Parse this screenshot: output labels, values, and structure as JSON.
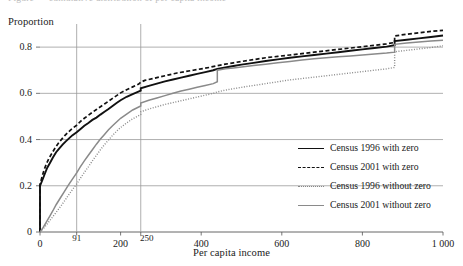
{
  "figure": {
    "cropped_caption": "Figure — cumulative distribution of per capita income"
  },
  "chart_data": {
    "type": "line",
    "title": "",
    "xlabel": "Per capita income",
    "ylabel": "Proportion",
    "xlim": [
      0,
      1000
    ],
    "ylim": [
      0,
      0.9
    ],
    "xticks": [
      0,
      91,
      200,
      250,
      400,
      600,
      800,
      1000
    ],
    "xticklabels": [
      "0",
      "91",
      "200",
      "250",
      "400",
      "600",
      "800",
      "1 000"
    ],
    "yticks": [
      0,
      0.2,
      0.4,
      0.6,
      0.8
    ],
    "yticklabels": [
      "0",
      "0.2",
      "0.4",
      "0.6",
      "0.8"
    ],
    "grid": "horizontal",
    "legend_position": "lower-right",
    "reference_lines": [
      {
        "name": "poverty-line-91",
        "x": 91,
        "label": "91"
      },
      {
        "name": "poverty-line-250",
        "x": 250,
        "label": "250"
      }
    ],
    "colors": {
      "census_1996_with_zero": "#111111",
      "census_2001_with_zero": "#111111",
      "census_1996_without_zero": "#8a8a8a",
      "census_2001_without_zero": "#8a8a8a",
      "gridline": "#9a9a9a",
      "axis": "#555555"
    },
    "series": [
      {
        "name": "Census 1996 with zero",
        "key": "census-1996-with-zero",
        "style": "solid",
        "color": "#111111",
        "width": 1.9,
        "points": [
          [
            0,
            0.0
          ],
          [
            0,
            0.2
          ],
          [
            6,
            0.225
          ],
          [
            12,
            0.252
          ],
          [
            18,
            0.278
          ],
          [
            25,
            0.3
          ],
          [
            32,
            0.322
          ],
          [
            40,
            0.345
          ],
          [
            48,
            0.362
          ],
          [
            56,
            0.378
          ],
          [
            64,
            0.392
          ],
          [
            72,
            0.405
          ],
          [
            80,
            0.418
          ],
          [
            91,
            0.432
          ],
          [
            100,
            0.445
          ],
          [
            110,
            0.46
          ],
          [
            120,
            0.472
          ],
          [
            130,
            0.485
          ],
          [
            140,
            0.495
          ],
          [
            150,
            0.508
          ],
          [
            160,
            0.52
          ],
          [
            170,
            0.532
          ],
          [
            180,
            0.545
          ],
          [
            190,
            0.558
          ],
          [
            200,
            0.57
          ],
          [
            215,
            0.585
          ],
          [
            230,
            0.597
          ],
          [
            250,
            0.612
          ],
          [
            250,
            0.622
          ],
          [
            270,
            0.632
          ],
          [
            290,
            0.642
          ],
          [
            310,
            0.652
          ],
          [
            330,
            0.66
          ],
          [
            350,
            0.668
          ],
          [
            370,
            0.676
          ],
          [
            390,
            0.684
          ],
          [
            410,
            0.692
          ],
          [
            430,
            0.7
          ],
          [
            440,
            0.706
          ],
          [
            460,
            0.712
          ],
          [
            480,
            0.718
          ],
          [
            500,
            0.724
          ],
          [
            530,
            0.732
          ],
          [
            560,
            0.74
          ],
          [
            590,
            0.747
          ],
          [
            620,
            0.754
          ],
          [
            650,
            0.76
          ],
          [
            680,
            0.766
          ],
          [
            710,
            0.772
          ],
          [
            740,
            0.778
          ],
          [
            770,
            0.784
          ],
          [
            800,
            0.79
          ],
          [
            830,
            0.796
          ],
          [
            860,
            0.802
          ],
          [
            880,
            0.808
          ],
          [
            880,
            0.826
          ],
          [
            910,
            0.832
          ],
          [
            940,
            0.838
          ],
          [
            970,
            0.844
          ],
          [
            1000,
            0.85
          ]
        ]
      },
      {
        "name": "Census 2001 with zero",
        "key": "census-2001-with-zero",
        "style": "dashed",
        "color": "#111111",
        "width": 1.7,
        "points": [
          [
            0,
            0.0
          ],
          [
            0,
            0.205
          ],
          [
            5,
            0.238
          ],
          [
            10,
            0.268
          ],
          [
            16,
            0.295
          ],
          [
            22,
            0.318
          ],
          [
            30,
            0.342
          ],
          [
            38,
            0.365
          ],
          [
            46,
            0.385
          ],
          [
            54,
            0.402
          ],
          [
            62,
            0.418
          ],
          [
            70,
            0.432
          ],
          [
            80,
            0.448
          ],
          [
            91,
            0.462
          ],
          [
            100,
            0.478
          ],
          [
            110,
            0.492
          ],
          [
            120,
            0.505
          ],
          [
            130,
            0.518
          ],
          [
            140,
            0.53
          ],
          [
            150,
            0.542
          ],
          [
            160,
            0.554
          ],
          [
            170,
            0.566
          ],
          [
            180,
            0.578
          ],
          [
            190,
            0.59
          ],
          [
            200,
            0.602
          ],
          [
            215,
            0.616
          ],
          [
            230,
            0.628
          ],
          [
            245,
            0.64
          ],
          [
            250,
            0.648
          ],
          [
            260,
            0.656
          ],
          [
            280,
            0.664
          ],
          [
            300,
            0.672
          ],
          [
            320,
            0.68
          ],
          [
            340,
            0.688
          ],
          [
            360,
            0.694
          ],
          [
            380,
            0.7
          ],
          [
            400,
            0.706
          ],
          [
            420,
            0.712
          ],
          [
            440,
            0.72
          ],
          [
            460,
            0.726
          ],
          [
            480,
            0.732
          ],
          [
            500,
            0.738
          ],
          [
            530,
            0.746
          ],
          [
            560,
            0.754
          ],
          [
            590,
            0.76
          ],
          [
            620,
            0.766
          ],
          [
            650,
            0.772
          ],
          [
            680,
            0.778
          ],
          [
            710,
            0.784
          ],
          [
            740,
            0.79
          ],
          [
            770,
            0.796
          ],
          [
            800,
            0.802
          ],
          [
            830,
            0.808
          ],
          [
            860,
            0.814
          ],
          [
            880,
            0.82
          ],
          [
            880,
            0.848
          ],
          [
            910,
            0.856
          ],
          [
            940,
            0.862
          ],
          [
            970,
            0.868
          ],
          [
            1000,
            0.872
          ]
        ]
      },
      {
        "name": "Census 1996 without zero",
        "key": "census-1996-without-zero",
        "style": "dotted",
        "color": "#8a8a8a",
        "width": 1.4,
        "points": [
          [
            0,
            0.0
          ],
          [
            10,
            0.018
          ],
          [
            20,
            0.04
          ],
          [
            30,
            0.062
          ],
          [
            40,
            0.085
          ],
          [
            50,
            0.108
          ],
          [
            60,
            0.132
          ],
          [
            70,
            0.158
          ],
          [
            80,
            0.182
          ],
          [
            91,
            0.208
          ],
          [
            100,
            0.232
          ],
          [
            110,
            0.258
          ],
          [
            120,
            0.282
          ],
          [
            130,
            0.308
          ],
          [
            140,
            0.332
          ],
          [
            150,
            0.356
          ],
          [
            160,
            0.378
          ],
          [
            170,
            0.398
          ],
          [
            180,
            0.418
          ],
          [
            190,
            0.436
          ],
          [
            200,
            0.452
          ],
          [
            215,
            0.472
          ],
          [
            230,
            0.49
          ],
          [
            250,
            0.508
          ],
          [
            250,
            0.52
          ],
          [
            270,
            0.532
          ],
          [
            290,
            0.542
          ],
          [
            310,
            0.552
          ],
          [
            330,
            0.56
          ],
          [
            350,
            0.568
          ],
          [
            370,
            0.576
          ],
          [
            390,
            0.584
          ],
          [
            410,
            0.592
          ],
          [
            430,
            0.6
          ],
          [
            440,
            0.606
          ],
          [
            460,
            0.614
          ],
          [
            480,
            0.62
          ],
          [
            500,
            0.626
          ],
          [
            530,
            0.634
          ],
          [
            560,
            0.642
          ],
          [
            590,
            0.65
          ],
          [
            620,
            0.658
          ],
          [
            650,
            0.664
          ],
          [
            680,
            0.67
          ],
          [
            710,
            0.676
          ],
          [
            740,
            0.682
          ],
          [
            770,
            0.688
          ],
          [
            800,
            0.694
          ],
          [
            830,
            0.7
          ],
          [
            860,
            0.706
          ],
          [
            880,
            0.712
          ],
          [
            880,
            0.78
          ],
          [
            910,
            0.786
          ],
          [
            940,
            0.792
          ],
          [
            970,
            0.798
          ],
          [
            1000,
            0.806
          ]
        ]
      },
      {
        "name": "Census 2001 without zero",
        "key": "census-2001-without-zero",
        "style": "thin-solid",
        "color": "#8a8a8a",
        "width": 1.5,
        "points": [
          [
            0,
            0.0
          ],
          [
            8,
            0.02
          ],
          [
            16,
            0.044
          ],
          [
            24,
            0.068
          ],
          [
            32,
            0.092
          ],
          [
            40,
            0.118
          ],
          [
            50,
            0.146
          ],
          [
            60,
            0.174
          ],
          [
            70,
            0.202
          ],
          [
            80,
            0.228
          ],
          [
            91,
            0.256
          ],
          [
            100,
            0.282
          ],
          [
            110,
            0.308
          ],
          [
            120,
            0.332
          ],
          [
            130,
            0.356
          ],
          [
            140,
            0.38
          ],
          [
            150,
            0.402
          ],
          [
            160,
            0.422
          ],
          [
            170,
            0.442
          ],
          [
            180,
            0.46
          ],
          [
            190,
            0.476
          ],
          [
            200,
            0.492
          ],
          [
            215,
            0.51
          ],
          [
            230,
            0.528
          ],
          [
            250,
            0.545
          ],
          [
            250,
            0.558
          ],
          [
            270,
            0.57
          ],
          [
            290,
            0.58
          ],
          [
            310,
            0.59
          ],
          [
            330,
            0.6
          ],
          [
            350,
            0.61
          ],
          [
            370,
            0.618
          ],
          [
            390,
            0.626
          ],
          [
            410,
            0.634
          ],
          [
            430,
            0.642
          ],
          [
            440,
            0.65
          ],
          [
            440,
            0.7
          ],
          [
            460,
            0.706
          ],
          [
            480,
            0.71
          ],
          [
            500,
            0.714
          ],
          [
            530,
            0.72
          ],
          [
            560,
            0.726
          ],
          [
            590,
            0.732
          ],
          [
            620,
            0.738
          ],
          [
            650,
            0.744
          ],
          [
            680,
            0.75
          ],
          [
            710,
            0.754
          ],
          [
            740,
            0.758
          ],
          [
            770,
            0.762
          ],
          [
            800,
            0.766
          ],
          [
            830,
            0.77
          ],
          [
            860,
            0.774
          ],
          [
            880,
            0.778
          ],
          [
            880,
            0.812
          ],
          [
            910,
            0.818
          ],
          [
            940,
            0.822
          ],
          [
            970,
            0.826
          ],
          [
            1000,
            0.83
          ]
        ]
      }
    ],
    "legend": [
      {
        "label": "Census 1996 with zero",
        "style": "solid",
        "color": "#111111"
      },
      {
        "label": "Census 2001 with zero",
        "style": "dashed",
        "color": "#111111"
      },
      {
        "label": "Census 1996 without zero",
        "style": "dotted",
        "color": "#8a8a8a"
      },
      {
        "label": "Census 2001 without zero",
        "style": "thin-solid",
        "color": "#8a8a8a"
      }
    ]
  }
}
